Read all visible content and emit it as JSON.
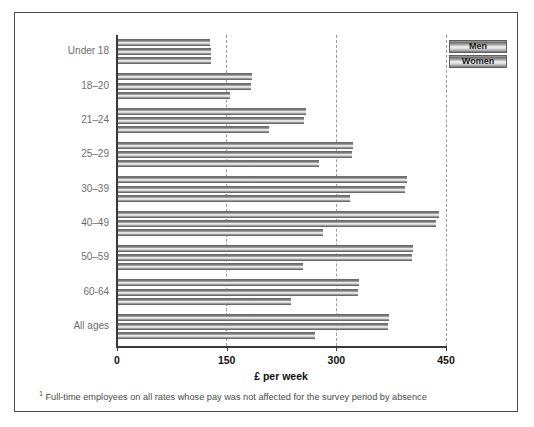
{
  "figure": {
    "footnote_marker": "1",
    "footnote_text": "Full-time employees on all rates whose pay was not affected for the survey period by absence"
  },
  "legend": {
    "items": [
      {
        "label": "Men",
        "color": "#8e8e8e"
      },
      {
        "label": "Women",
        "color": "#8e8e8e"
      }
    ]
  },
  "chart_data": {
    "type": "bar",
    "orientation": "horizontal",
    "title": "",
    "xlabel": "£ per week",
    "ylabel": "",
    "xlim": [
      0,
      450
    ],
    "xticks": [
      0,
      150,
      300,
      450
    ],
    "xtick_labels": [
      "0",
      "150",
      "300",
      "450"
    ],
    "grid": "vertical-dashed",
    "legend_position": "top-right",
    "categories": [
      "Under 18",
      "18–20",
      "21–24",
      "25–29",
      "30–39",
      "40–49",
      "50–59",
      "60-64",
      "All ages"
    ],
    "series": [
      {
        "name": "Men",
        "values": [
          127,
          185,
          258,
          323,
          396,
          440,
          405,
          331,
          372
        ]
      },
      {
        "name": "All",
        "values": [
          128,
          183,
          256,
          321,
          394,
          437,
          403,
          329,
          370
        ]
      },
      {
        "name": "Women",
        "values": [
          129,
          155,
          208,
          276,
          319,
          282,
          254,
          238,
          271
        ]
      }
    ]
  }
}
